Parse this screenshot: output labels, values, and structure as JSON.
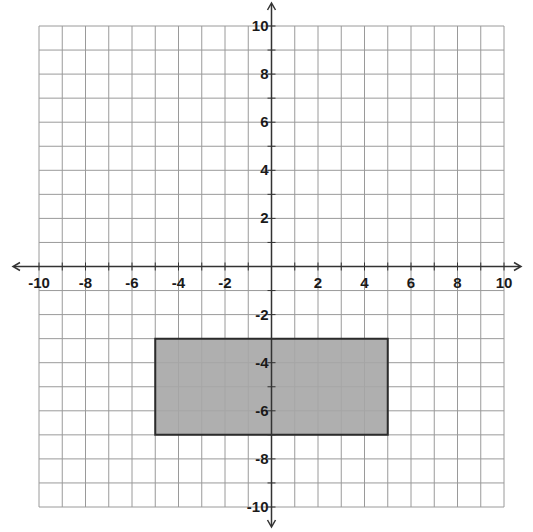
{
  "chart_data": {
    "type": "coordinate-plane",
    "title": "",
    "xlabel": "",
    "ylabel": "",
    "xlim": [
      -10,
      10
    ],
    "ylim": [
      -10,
      10
    ],
    "grid": true,
    "grid_step": 1,
    "x_tick_labels": [
      "-10",
      "-8",
      "-6",
      "-4",
      "-2",
      "2",
      "4",
      "6",
      "8",
      "10"
    ],
    "x_tick_values": [
      -10,
      -8,
      -6,
      -4,
      -2,
      2,
      4,
      6,
      8,
      10
    ],
    "y_tick_labels": [
      "10",
      "8",
      "6",
      "4",
      "2",
      "-2",
      "-4",
      "-6",
      "-8",
      "-10"
    ],
    "y_tick_values": [
      10,
      8,
      6,
      4,
      2,
      -2,
      -4,
      -6,
      -8,
      -10
    ],
    "axes_arrows": true,
    "shapes": [
      {
        "name": "rectangle",
        "vertices": [
          [
            -5,
            -3
          ],
          [
            5,
            -3
          ],
          [
            5,
            -7
          ],
          [
            -5,
            -7
          ]
        ],
        "fill": "#a6a6a6",
        "stroke": "#2b2b2b",
        "width": 10,
        "height": 4
      }
    ]
  },
  "colors": {
    "grid": "#9a9a9a",
    "axis": "#333333",
    "label": "#1a1a1a",
    "shape_fill": "#a6a6a6",
    "shape_stroke": "#2b2b2b"
  }
}
